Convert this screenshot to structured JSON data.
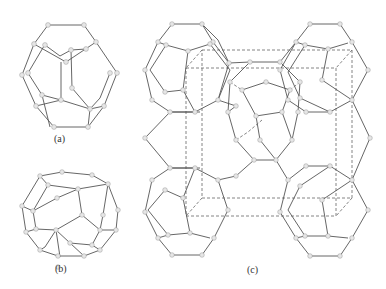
{
  "figure": {
    "panels": [
      {
        "id": "a",
        "label": "(a)",
        "description": "pentagonal dodecahedron cage (5^12)"
      },
      {
        "id": "b",
        "label": "(b)",
        "description": "tetrakaidecahedron cage (5^12 6^2)"
      },
      {
        "id": "c",
        "label": "(c)",
        "description": "clathrate unit cell with dashed cubic cell outline"
      }
    ]
  }
}
